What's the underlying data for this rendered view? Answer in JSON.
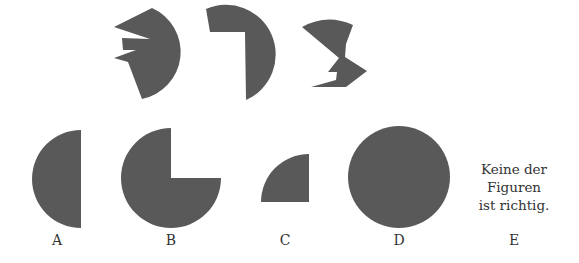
{
  "colors": {
    "shape_fill": "#595959",
    "text": "#333333",
    "background": "#ffffff"
  },
  "pieces": [
    {
      "id": "piece-1",
      "description": "jagged sector piece with arc on right"
    },
    {
      "id": "piece-2",
      "description": "sector piece with rectangular notch at top-left"
    },
    {
      "id": "piece-3",
      "description": "zig-zag piece with arc on top"
    }
  ],
  "options": [
    {
      "letter": "A",
      "shape": "half-circle"
    },
    {
      "letter": "B",
      "shape": "three-quarter-circle"
    },
    {
      "letter": "C",
      "shape": "quarter-circle"
    },
    {
      "letter": "D",
      "shape": "full-circle"
    },
    {
      "letter": "E",
      "shape": "text"
    }
  ],
  "option_e_text": [
    "Keine der",
    "Figuren",
    "ist richtig."
  ]
}
